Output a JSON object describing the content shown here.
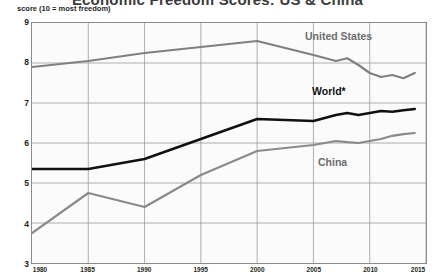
{
  "title": "Economic Freedom Scores: US & China",
  "subtitle": "score (10 = most freedom)",
  "labels": {
    "united_states": "United States",
    "world": "World*",
    "china": "China"
  },
  "colors": {
    "united_states": "#808080",
    "world": "#111111",
    "china": "#8a8a8a",
    "grid": "#9a9a9a",
    "frame": "#8c8c8c",
    "plot_background": "#fbfbfb"
  },
  "chart_data": {
    "type": "line",
    "title": "Economic Freedom Scores: US & China",
    "subtitle": "score (10 = most freedom)",
    "xlabel": "",
    "ylabel": "score (10 = most freedom)",
    "xlim": [
      1980,
      2015
    ],
    "ylim": [
      3,
      9
    ],
    "xticks": [
      1980,
      1985,
      1990,
      1995,
      2000,
      2005,
      2010,
      2015
    ],
    "yticks": [
      3,
      4,
      5,
      6,
      7,
      8,
      9
    ],
    "grid": true,
    "legend": "inline-annotations",
    "annotations": [
      "United States",
      "World*",
      "China"
    ],
    "footnote_marker": "*",
    "series": [
      {
        "name": "United States",
        "color": "#808080",
        "x": [
          1980,
          1985,
          1990,
          1995,
          2000,
          2005,
          2007,
          2008,
          2009,
          2010,
          2011,
          2012,
          2013,
          2014
        ],
        "values": [
          7.9,
          8.05,
          8.25,
          8.4,
          8.55,
          8.2,
          8.05,
          8.12,
          7.95,
          7.75,
          7.65,
          7.7,
          7.62,
          7.75
        ]
      },
      {
        "name": "World*",
        "color": "#111111",
        "x": [
          1980,
          1985,
          1990,
          1995,
          2000,
          2005,
          2007,
          2008,
          2009,
          2010,
          2011,
          2012,
          2013,
          2014
        ],
        "values": [
          5.35,
          5.35,
          5.6,
          6.1,
          6.6,
          6.55,
          6.7,
          6.75,
          6.7,
          6.75,
          6.8,
          6.78,
          6.82,
          6.85
        ]
      },
      {
        "name": "China",
        "color": "#8a8a8a",
        "x": [
          1980,
          1985,
          1990,
          1995,
          2000,
          2005,
          2007,
          2008,
          2009,
          2010,
          2011,
          2012,
          2013,
          2014
        ],
        "values": [
          3.75,
          4.75,
          4.4,
          5.2,
          5.8,
          5.95,
          6.05,
          6.02,
          6.0,
          6.05,
          6.1,
          6.18,
          6.22,
          6.25
        ]
      }
    ]
  }
}
